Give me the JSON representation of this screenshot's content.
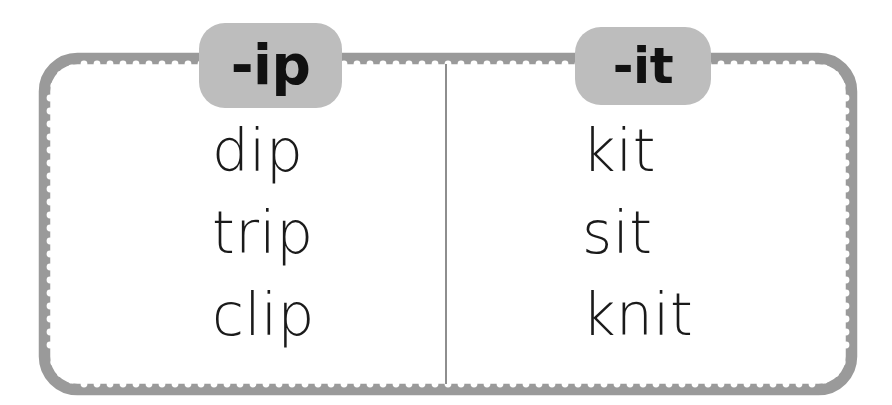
{
  "worksheet": {
    "title": "Word family sort: -ip and -it",
    "background_color": "#ffffff",
    "border_color": "#9a9a9a",
    "border_dot_color": "#ffffff",
    "divider_color": "#8e8e8e",
    "pill_color": "#bdbdbd",
    "text_color": "#1a1a1a"
  },
  "columns": [
    {
      "header": "-ip",
      "words": [
        "dip",
        "trip",
        "clip"
      ]
    },
    {
      "header": "-it",
      "words": [
        "kit",
        "sit",
        "knit"
      ]
    }
  ]
}
